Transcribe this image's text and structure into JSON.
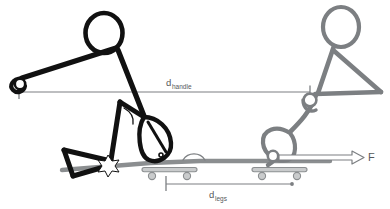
{
  "figure": {
    "canvas": {
      "width": 390,
      "height": 209,
      "background": "#ffffff"
    }
  },
  "colors": {
    "pose_initial": "#111111",
    "pose_final": "#7c7f82",
    "dimension_line": "#7c7f82",
    "label_text": "#55585a",
    "equipment": "#8b8e90",
    "contact_marker": "#ffffff"
  },
  "labels": {
    "d_handle": {
      "base": "d",
      "sub": "handle"
    },
    "d_legs": {
      "base": "d",
      "sub": "legs"
    },
    "force": {
      "text": "F"
    }
  },
  "poses": [
    {
      "name": "initial-pose",
      "color_key": "pose_initial",
      "description": "catch position, knees bent, arms extended forward to handle"
    },
    {
      "name": "final-pose",
      "color_key": "pose_final",
      "description": "finish position, legs extended, body leaning back"
    }
  ],
  "equipment": [
    {
      "name": "seat-roller-initial",
      "wheels": 2
    },
    {
      "name": "seat-roller-final",
      "wheels": 2
    }
  ],
  "dimensions": [
    {
      "name": "d-handle",
      "label_key": "d_handle",
      "start_marker": "tick",
      "end_marker": "tick"
    },
    {
      "name": "d-legs",
      "label_key": "d_legs",
      "start_marker": "tick",
      "end_marker": "dot"
    }
  ],
  "annotations": [
    {
      "name": "force-arrow",
      "label_key": "force",
      "style": "outlined-arrow",
      "direction": "right"
    },
    {
      "name": "hip-angle-arc-initial",
      "style": "arc"
    },
    {
      "name": "knee-angle-arc-final",
      "style": "arc"
    },
    {
      "name": "foot-contact-star",
      "style": "star-burst"
    }
  ]
}
